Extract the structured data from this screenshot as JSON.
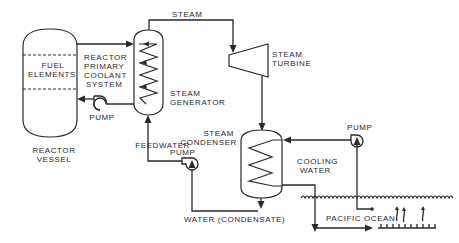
{
  "diagram": {
    "colors": {
      "line": "#2a2a2a",
      "background": "#ffffff"
    },
    "labels": {
      "steam": "STEAM",
      "fuel_elements": [
        "FUEL",
        "ELEMENTS"
      ],
      "reactor_vessel": [
        "REACTOR",
        "VESSEL"
      ],
      "primary_coolant": [
        "REACTOR",
        "PRIMARY",
        "COOLANT",
        "SYSTEM"
      ],
      "primary_pump": "PUMP",
      "steam_generator": [
        "STEAM",
        "GENERATOR"
      ],
      "steam_turbine": [
        "STEAM",
        "TURBINE"
      ],
      "steam_condenser": [
        "STEAM",
        "CONDENSER"
      ],
      "cooling_pump": "PUMP",
      "cooling_water": [
        "COOLING",
        "WATER"
      ],
      "feedwater_pump": [
        "FEEDWATER",
        "PUMP"
      ],
      "condensate": "WATER (CONDENSATE)",
      "ocean": "PACIFIC OCEAN"
    },
    "components": [
      {
        "id": "reactor-vessel",
        "label": "REACTOR VESSEL",
        "contains": "FUEL ELEMENTS"
      },
      {
        "id": "steam-generator",
        "label": "STEAM GENERATOR"
      },
      {
        "id": "steam-turbine",
        "label": "STEAM TURBINE"
      },
      {
        "id": "steam-condenser",
        "label": "STEAM CONDENSER"
      },
      {
        "id": "primary-pump",
        "label": "PUMP"
      },
      {
        "id": "feedwater-pump",
        "label": "FEEDWATER PUMP"
      },
      {
        "id": "cooling-pump",
        "label": "PUMP"
      },
      {
        "id": "pacific-ocean",
        "label": "PACIFIC OCEAN"
      }
    ],
    "flows": [
      {
        "from": "reactor-vessel",
        "to": "steam-generator",
        "medium": "primary coolant"
      },
      {
        "from": "steam-generator",
        "to": "primary-pump",
        "medium": "primary coolant"
      },
      {
        "from": "primary-pump",
        "to": "reactor-vessel",
        "medium": "primary coolant"
      },
      {
        "from": "steam-generator",
        "to": "steam-turbine",
        "medium": "STEAM"
      },
      {
        "from": "steam-turbine",
        "to": "steam-condenser",
        "medium": "steam"
      },
      {
        "from": "steam-condenser",
        "to": "feedwater-pump",
        "medium": "WATER (CONDENSATE)"
      },
      {
        "from": "feedwater-pump",
        "to": "steam-generator",
        "medium": "feedwater"
      },
      {
        "from": "pacific-ocean",
        "to": "cooling-pump",
        "medium": "COOLING WATER"
      },
      {
        "from": "cooling-pump",
        "to": "steam-condenser",
        "medium": "COOLING WATER"
      },
      {
        "from": "steam-condenser",
        "to": "pacific-ocean",
        "medium": "COOLING WATER"
      }
    ]
  }
}
